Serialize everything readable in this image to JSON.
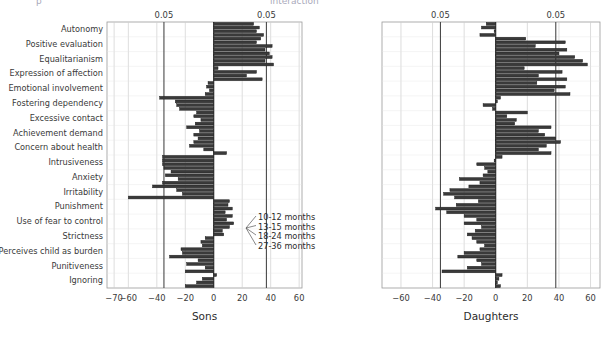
{
  "header": {
    "left_fragment": "p",
    "right_fragment": "interaction"
  },
  "chart_data": {
    "type": "bar",
    "orientation": "horizontal",
    "title": "",
    "categories": [
      "Autonomy",
      "Positive evaluation",
      "Equalitarianism",
      "Expression of affection",
      "Emotional involvement",
      "Fostering dependency",
      "Excessive contact",
      "Achievement demand",
      "Concern about health",
      "Intrusiveness",
      "Anxiety",
      "Irritability",
      "Punishment",
      "Use of fear to control",
      "Strictness",
      "Perceives child as burden",
      "Punitiveness",
      "Ignoring"
    ],
    "legend": {
      "position": "inside-right",
      "entries": [
        "10-12 months",
        "13-15 months",
        "18-24 months",
        "27-36 months"
      ]
    },
    "panels": [
      {
        "name": "sons",
        "xlabel": "Sons",
        "xlim": [
          -75,
          62
        ],
        "ticks": [
          -70,
          -60,
          -40,
          -20,
          0,
          20,
          40,
          60
        ],
        "tick_labels": [
          "-70",
          "-60",
          "-40",
          "-20",
          "0",
          "20",
          "40",
          "60"
        ],
        "ref_lines": [
          -35,
          37
        ],
        "ref_label": "0.05",
        "grid": true,
        "series": [
          {
            "name": "10-12 months",
            "values": [
              28,
              33,
              39,
              3,
              -4,
              -38,
              -12,
              -19,
              -14,
              -36,
              -30,
              -43,
              11,
              13,
              6,
              -8,
              -11,
              2
            ]
          },
          {
            "name": "13-15 months",
            "values": [
              32,
              30,
              41,
              30,
              -5,
              -27,
              -14,
              -10,
              -17,
              -36,
              -34,
              -26,
              10,
              9,
              7,
              -23,
              -19,
              -8
            ]
          },
          {
            "name": "18-24 months",
            "values": [
              30,
              41,
              36,
              23,
              -3,
              -26,
              -9,
              -14,
              -7,
              -36,
              -25,
              -22,
              13,
              14,
              -6,
              -22,
              -6,
              -12
            ]
          },
          {
            "name": "27-36 months",
            "values": [
              35,
              36,
              42,
              34,
              -6,
              -24,
              -13,
              -11,
              9,
              -35,
              -36,
              -60,
              8,
              11,
              -9,
              -31,
              -20,
              -20
            ]
          }
        ]
      },
      {
        "name": "daughters",
        "xlabel": "Daughters",
        "xlim": [
          -72,
          66
        ],
        "ticks": [
          -60,
          -40,
          -20,
          0,
          20,
          40,
          60
        ],
        "tick_labels": [
          "-60",
          "-40",
          "-20",
          "0",
          "20",
          "40",
          "60"
        ],
        "ref_lines": [
          -35,
          38
        ],
        "ref_label": "0.05",
        "grid": true,
        "series": [
          {
            "name": "10-12 months",
            "values": [
              -6,
              19,
              40,
              18,
              26,
              3,
              20,
              35,
              41,
              4,
              -5,
              -17,
              -11,
              -20,
              -13,
              -7,
              -12,
              4
            ]
          },
          {
            "name": "13-15 months",
            "values": [
              -9,
              44,
              50,
              42,
              44,
              1,
              7,
              27,
              32,
              -1,
              -8,
              -29,
              -25,
              -12,
              -18,
              -10,
              -9,
              2
            ]
          },
          {
            "name": "18-24 months",
            "values": [
              -1,
              25,
              55,
              27,
              37,
              -8,
              13,
              31,
              27,
              -12,
              -23,
              -33,
              -38,
              -20,
              -15,
              -20,
              -18,
              1
            ]
          },
          {
            "name": "27-36 months",
            "values": [
              -10,
              45,
              58,
              45,
              47,
              -2,
              12,
              38,
              35,
              -7,
              -10,
              -26,
              -31,
              -9,
              -12,
              -24,
              -34,
              3
            ]
          }
        ]
      }
    ]
  }
}
